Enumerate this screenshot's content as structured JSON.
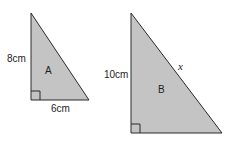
{
  "diagram": {
    "type": "similar right triangles",
    "colors": {
      "fill": "#c4c4c4",
      "stroke": "#2a2a2a",
      "text": "#1e1e1e"
    },
    "triangles": [
      {
        "name": "A",
        "label": "A",
        "vertical_side": "8cm",
        "horizontal_side": "6cm",
        "hypotenuse": "",
        "right_angle_marker": true
      },
      {
        "name": "B",
        "label": "B",
        "vertical_side": "10cm",
        "horizontal_side": "",
        "hypotenuse": "x",
        "right_angle_marker": true
      }
    ]
  }
}
